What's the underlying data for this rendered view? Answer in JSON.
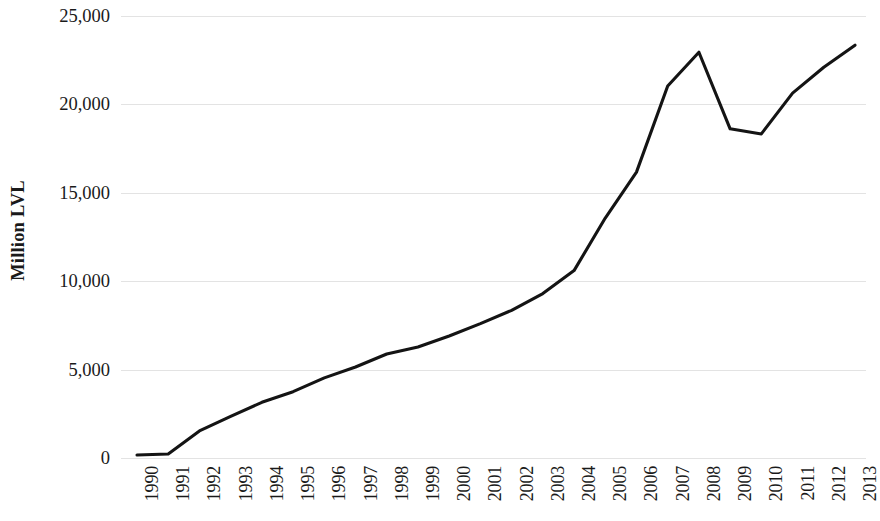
{
  "chart_data": {
    "type": "line",
    "title": "",
    "subtitle": "",
    "xlabel": "",
    "ylabel": "Million LVL",
    "categories": [
      "1990",
      "1991",
      "1992",
      "1993",
      "1994",
      "1995",
      "1996",
      "1997",
      "1998",
      "1999",
      "2000",
      "2001",
      "2002",
      "2003",
      "2004",
      "2005",
      "2006",
      "2007",
      "2008",
      "2009",
      "2010",
      "2011",
      "2012",
      "2013"
    ],
    "values": [
      170,
      230,
      1530,
      2350,
      3150,
      3750,
      4530,
      5150,
      5880,
      6280,
      6900,
      7600,
      8350,
      9300,
      10600,
      13570,
      16170,
      21040,
      22950,
      18620,
      18330,
      20640,
      22100,
      23350
    ],
    "series": [
      {
        "name": "Million LVL",
        "values": [
          170,
          230,
          1530,
          2350,
          3150,
          3750,
          4530,
          5150,
          5880,
          6280,
          6900,
          7600,
          8350,
          9300,
          10600,
          13570,
          16170,
          21040,
          22950,
          18620,
          18330,
          20640,
          22100,
          23350
        ]
      }
    ],
    "ylim": [
      0,
      25000
    ],
    "yticks": [
      0,
      5000,
      10000,
      15000,
      20000,
      25000
    ],
    "ytick_labels": [
      "0",
      "5,000",
      "10,000",
      "15,000",
      "20,000",
      "25,000"
    ],
    "grid": true,
    "grid_axis": "y",
    "legend": false,
    "legend_position": "none",
    "line_color": "#141414",
    "grid_color": "#e3e3e3",
    "background_color": "#ffffff",
    "marker": "none"
  }
}
